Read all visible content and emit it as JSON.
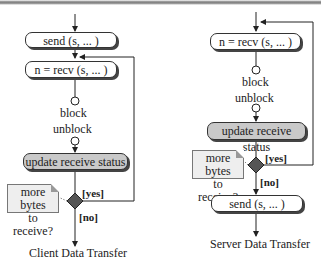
{
  "client": {
    "send_label": "send (s, ... )",
    "recv_label": "n = recv (s, ... )",
    "block_label": "block",
    "unblock_label": "unblock",
    "update_label": "update receive status",
    "note_line1": "more bytes",
    "note_line2": "to receive?",
    "yes_label": "[yes]",
    "no_label": "[no]",
    "caption": "Client Data Transfer"
  },
  "server": {
    "recv_label": "n = recv (s, ... )",
    "block_label": "block",
    "unblock_label": "unblock",
    "update_label": "update receive status",
    "note_line1": "more bytes",
    "note_line2": "to receive?",
    "yes_label": "[yes]",
    "no_label": "[no]",
    "send_label": "send (s, ... )",
    "caption": "Server Data Transfer"
  },
  "colors": {
    "action_fill": "#ffffff",
    "status_fill": "#c9c9c9",
    "decision_fill": "#555555",
    "note_fill": "#eeeeee"
  }
}
